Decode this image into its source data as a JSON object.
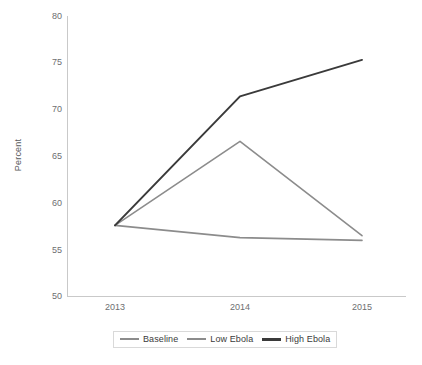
{
  "chart_data": {
    "type": "line",
    "title": "",
    "xlabel": "",
    "ylabel": "Percent",
    "categories": [
      "2013",
      "2014",
      "2015"
    ],
    "x": [
      2013,
      2014,
      2015
    ],
    "ylim": [
      50,
      80
    ],
    "yticks": [
      50,
      55,
      60,
      65,
      70,
      75,
      80
    ],
    "ytick_labels": [
      "50",
      "55",
      "60",
      "65",
      "70",
      "75",
      "80"
    ],
    "grid": false,
    "legend_position": "bottom",
    "series": [
      {
        "name": "Baseline",
        "values": [
          57.6,
          56.3,
          56.0
        ],
        "color": "#8c8c8c",
        "width": 1.6
      },
      {
        "name": "Low Ebola",
        "values": [
          57.6,
          66.6,
          56.5
        ],
        "color": "#8c8c8c",
        "width": 1.6
      },
      {
        "name": "High Ebola",
        "values": [
          57.6,
          71.4,
          75.3
        ],
        "color": "#3a3a3a",
        "width": 2.0
      }
    ]
  },
  "axes": {
    "y_title": "Percent",
    "y_tick_labels": [
      "80",
      "75",
      "70",
      "65",
      "60",
      "55",
      "50"
    ],
    "x_tick_labels": [
      "2013",
      "2014",
      "2015"
    ],
    "axis_color": "#c9c9c9"
  },
  "legend": {
    "items": [
      {
        "label": "Baseline",
        "color": "#8c8c8c"
      },
      {
        "label": "Low Ebola",
        "color": "#8c8c8c"
      },
      {
        "label": "High Ebola",
        "color": "#3a3a3a"
      }
    ]
  },
  "footer": {
    "note": ""
  }
}
